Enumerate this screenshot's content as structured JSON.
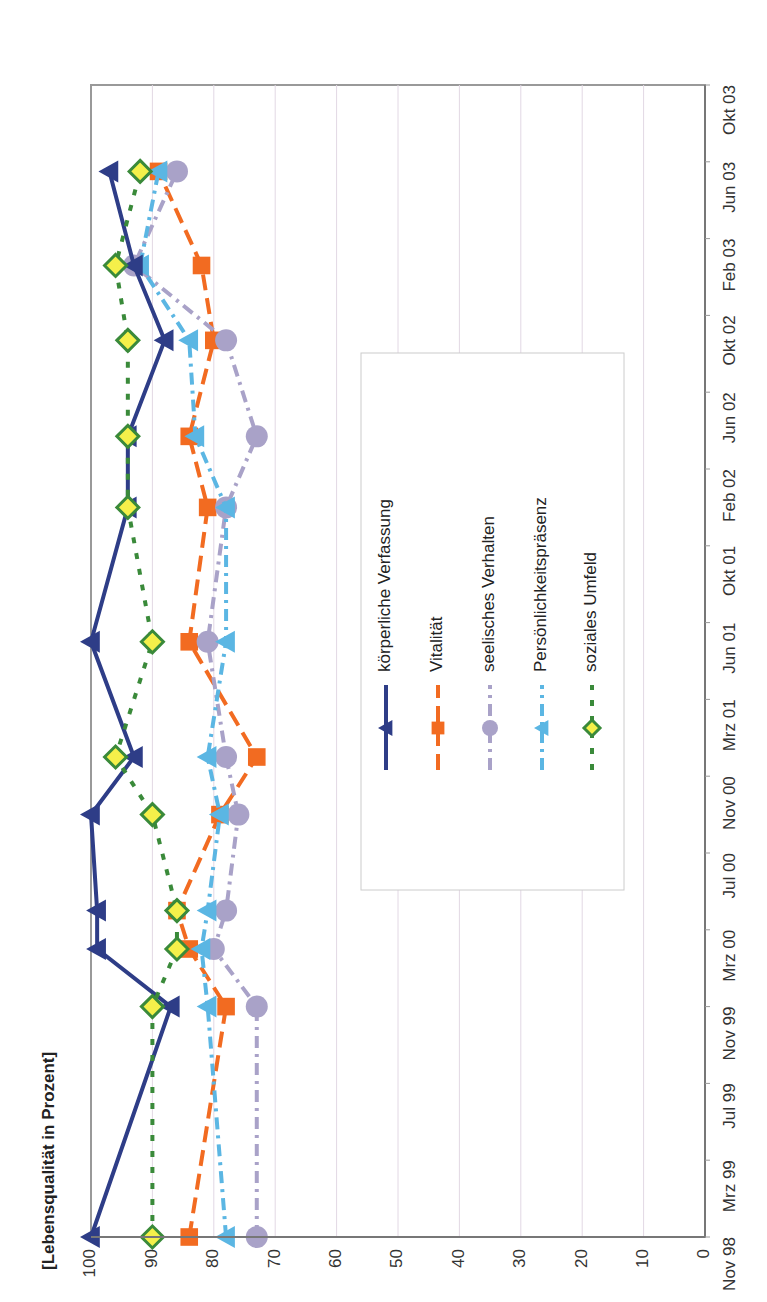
{
  "chart_data": {
    "type": "line",
    "title": "",
    "ylabel": "[Lebensqualität in Prozent]",
    "xlabel": "",
    "ylim": [
      0,
      100
    ],
    "yticks": [
      0,
      10,
      20,
      30,
      40,
      50,
      60,
      70,
      80,
      90,
      100
    ],
    "xtick_labels": [
      "Nov 98",
      "Mrz 99",
      "Jul 99",
      "Nov 99",
      "Mrz 00",
      "Jul 00",
      "Nov 00",
      "Mrz 01",
      "Jun 01",
      "Okt 01",
      "Feb 02",
      "Jun 02",
      "Okt 02",
      "Feb 03",
      "Jun 03",
      "Okt 03"
    ],
    "grid": true,
    "orientation": "rotated 90° counter-clockwise on page",
    "legend_position": "inside plot, center-right",
    "x": [
      "Nov 98",
      "Nov 99",
      "Feb 00",
      "Apr 00",
      "Sep 00",
      "Dez 00",
      "Jun 01",
      "Jan 02",
      "Apr 02",
      "Sep 02",
      "Jan 03",
      "Mai 03"
    ],
    "x_months_from_start": [
      0,
      12,
      15,
      17,
      22,
      25,
      31,
      38,
      41.7,
      46.7,
      50.6,
      55.5
    ],
    "series": [
      {
        "name": "körperliche Verfassung",
        "color": "#2e3d87",
        "marker": "triangle",
        "dash": "solid",
        "values": [
          100,
          87,
          99,
          99,
          100,
          93,
          100,
          94,
          94,
          88,
          93,
          97
        ]
      },
      {
        "name": "Vitalität",
        "color": "#f26b21",
        "marker": "square",
        "dash": "long-dash",
        "values": [
          84,
          78,
          84,
          86,
          79,
          73,
          84,
          81,
          84,
          80,
          82,
          89
        ]
      },
      {
        "name": "seelisches Verhalten",
        "color": "#a9a2c8",
        "marker": "circle",
        "dash": "dash-dot",
        "values": [
          73,
          73,
          80,
          78,
          76,
          78,
          81,
          78,
          73,
          78,
          93,
          86
        ]
      },
      {
        "name": "Persönlichkeitspräsenz",
        "color": "#5bb6e3",
        "marker": "triangle",
        "dash": "dash-dot",
        "values": [
          78,
          81,
          82,
          81,
          79,
          81,
          78,
          78,
          83,
          84,
          92,
          89
        ]
      },
      {
        "name": "soziales Umfeld",
        "color": "#3a8a3a",
        "marker": "diamond",
        "marker_fill": "#f5f04a",
        "dash": "dotted",
        "values": [
          90,
          90,
          86,
          86,
          90,
          96,
          90,
          94,
          94,
          94,
          96,
          92
        ]
      }
    ]
  }
}
